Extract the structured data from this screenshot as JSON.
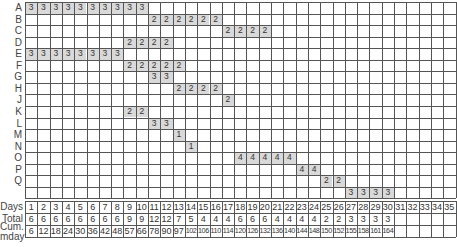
{
  "chart_data": {
    "type": "table",
    "title": "",
    "rows": [
      "A",
      "B",
      "C",
      "D",
      "E",
      "F",
      "G",
      "H",
      "J",
      "K",
      "L",
      "M",
      "N",
      "O",
      "P",
      "Q",
      ""
    ],
    "days": [
      1,
      2,
      3,
      4,
      5,
      6,
      7,
      8,
      9,
      10,
      11,
      12,
      13,
      14,
      15,
      16,
      17,
      18,
      19,
      20,
      21,
      22,
      23,
      24,
      25,
      26,
      27,
      28,
      29,
      30,
      31,
      32,
      33,
      34,
      35
    ],
    "activities": [
      {
        "row": "A",
        "start": 1,
        "end": 10,
        "value": 3
      },
      {
        "row": "B",
        "start": 11,
        "end": 16,
        "value": 2
      },
      {
        "row": "C",
        "start": 17,
        "end": 20,
        "value": 2
      },
      {
        "row": "D",
        "start": 9,
        "end": 12,
        "value": 2
      },
      {
        "row": "E",
        "start": 1,
        "end": 8,
        "value": 3
      },
      {
        "row": "F",
        "start": 9,
        "end": 13,
        "value": 2
      },
      {
        "row": "G",
        "start": 11,
        "end": 12,
        "value": 3
      },
      {
        "row": "H",
        "start": 13,
        "end": 16,
        "value": 2
      },
      {
        "row": "J",
        "start": 17,
        "end": 17,
        "value": 2
      },
      {
        "row": "K",
        "start": 9,
        "end": 10,
        "value": 2
      },
      {
        "row": "L",
        "start": 11,
        "end": 12,
        "value": 3
      },
      {
        "row": "M",
        "start": 13,
        "end": 13,
        "value": 1
      },
      {
        "row": "N",
        "start": 14,
        "end": 14,
        "value": 1
      },
      {
        "row": "O",
        "start": 18,
        "end": 22,
        "value": 4
      },
      {
        "row": "P",
        "start": 23,
        "end": 24,
        "value": 4
      },
      {
        "row": "Q",
        "start": 25,
        "end": 26,
        "value": 2
      },
      {
        "row": "",
        "start": 27,
        "end": 30,
        "value": 3
      }
    ],
    "summary_rows": [
      {
        "label": "Days",
        "values": [
          "1",
          "2",
          "3",
          "4",
          "5",
          "6",
          "7",
          "8",
          "9",
          "10",
          "11",
          "12",
          "13",
          "14",
          "15",
          "16",
          "17",
          "18",
          "19",
          "20",
          "21",
          "22",
          "23",
          "24",
          "25",
          "26",
          "27",
          "28",
          "29",
          "30",
          "31",
          "32",
          "33",
          "34",
          "35"
        ]
      },
      {
        "label": "Total",
        "values": [
          "6",
          "6",
          "6",
          "6",
          "6",
          "6",
          "6",
          "6",
          "9",
          "9",
          "12",
          "12",
          "7",
          "5",
          "4",
          "4",
          "4",
          "6",
          "6",
          "6",
          "4",
          "4",
          "4",
          "4",
          "2",
          "2",
          "3",
          "3",
          "3",
          "3",
          "",
          "",
          "",
          "",
          ""
        ]
      },
      {
        "label": "Cum.\nmday",
        "values": [
          "6",
          "12",
          "18",
          "24",
          "30",
          "36",
          "42",
          "48",
          "57",
          "66",
          "78",
          "90",
          "97",
          "102",
          "106",
          "110",
          "114",
          "120",
          "126",
          "132",
          "136",
          "140",
          "144",
          "148",
          "150",
          "152",
          "155",
          "158",
          "161",
          "164",
          "",
          "",
          "",
          "",
          ""
        ]
      }
    ],
    "xlabel": "Days",
    "ylabel": "",
    "colors": {
      "bar": "#d9d9d9",
      "grid": "#555555"
    }
  }
}
